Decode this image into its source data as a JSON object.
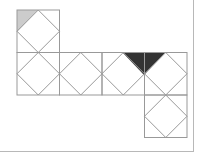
{
  "diagram": {
    "type": "cube-net",
    "cell_size": 42.5,
    "origin": [
      17,
      10
    ],
    "cells": [
      {
        "col": 0,
        "row": 0
      },
      {
        "col": 0,
        "row": 1
      },
      {
        "col": 1,
        "row": 1
      },
      {
        "col": 2,
        "row": 1
      },
      {
        "col": 3,
        "row": 1
      },
      {
        "col": 3,
        "row": 2
      }
    ],
    "shaded": [
      {
        "name": "light-triangle",
        "color": "#cccccc",
        "points": [
          [
            17,
            10
          ],
          [
            38,
            10
          ],
          [
            17,
            32
          ]
        ]
      },
      {
        "name": "dark-triangle",
        "color": "#333333",
        "points": [
          [
            123,
            53
          ],
          [
            165,
            53
          ],
          [
            144,
            75
          ]
        ]
      }
    ],
    "colors": {
      "line": "#999999",
      "frame": "#b8b8b8",
      "background": "#ffffff"
    }
  }
}
